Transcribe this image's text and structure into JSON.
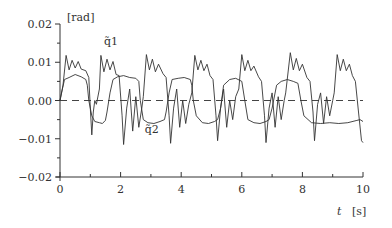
{
  "chart_data": {
    "type": "line",
    "title": "",
    "xlabel": "t",
    "xlabel_unit": "[s]",
    "ylabel": "",
    "ylabel_unit": "[rad]",
    "xlim": [
      0,
      10
    ],
    "ylim": [
      -0.02,
      0.02
    ],
    "x_ticks": [
      0,
      2,
      4,
      6,
      8,
      10
    ],
    "x_tick_labels": [
      "0",
      "2",
      "4",
      "6",
      "8",
      "10"
    ],
    "x_minor_ticks": [
      1,
      3,
      5,
      7,
      9
    ],
    "y_ticks": [
      -0.02,
      -0.01,
      0.0,
      0.01,
      0.02
    ],
    "y_tick_labels": [
      "−0.02",
      "−0.01",
      "0.00",
      "0.01",
      "0.02"
    ],
    "y_minor_ticks": [
      -0.015,
      -0.005,
      0.005,
      0.015
    ],
    "grid": false,
    "reference_line": {
      "y": 0.0,
      "style": "dashed"
    },
    "legend": "inline labels",
    "series": [
      {
        "name": "q̃1",
        "label_position": {
          "t": 1.45,
          "v": 0.0145
        },
        "points": [
          [
            0.0,
            0.0
          ],
          [
            0.1,
            0.004
          ],
          [
            0.2,
            0.0118
          ],
          [
            0.3,
            0.008
          ],
          [
            0.4,
            0.0105
          ],
          [
            0.5,
            0.0085
          ],
          [
            0.6,
            0.0102
          ],
          [
            0.7,
            0.0082
          ],
          [
            0.85,
            0.0078
          ],
          [
            0.95,
            0.006
          ],
          [
            1.0,
            -0.002
          ],
          [
            1.05,
            -0.009
          ],
          [
            1.1,
            -0.003
          ],
          [
            1.15,
            0.0
          ],
          [
            1.2,
            -0.001
          ],
          [
            1.3,
            0.003
          ],
          [
            1.35,
            0.0118
          ],
          [
            1.45,
            0.0075
          ],
          [
            1.55,
            0.0108
          ],
          [
            1.65,
            0.008
          ],
          [
            1.75,
            0.0102
          ],
          [
            1.85,
            0.0068
          ],
          [
            1.95,
            0.0065
          ],
          [
            2.05,
            -0.004
          ],
          [
            2.1,
            -0.0115
          ],
          [
            2.2,
            -0.002
          ],
          [
            2.3,
            0.003
          ],
          [
            2.4,
            -0.008
          ],
          [
            2.5,
            0.001
          ],
          [
            2.6,
            -0.007
          ],
          [
            2.7,
            -0.002
          ],
          [
            2.75,
            0.001
          ],
          [
            2.85,
            0.012
          ],
          [
            2.95,
            0.008
          ],
          [
            3.05,
            0.0108
          ],
          [
            3.15,
            0.0075
          ],
          [
            3.25,
            0.0095
          ],
          [
            3.4,
            0.007
          ],
          [
            3.5,
            0.006
          ],
          [
            3.6,
            -0.004
          ],
          [
            3.65,
            -0.0112
          ],
          [
            3.75,
            -0.002
          ],
          [
            3.85,
            0.003
          ],
          [
            3.95,
            -0.007
          ],
          [
            4.05,
            0.0
          ],
          [
            4.15,
            -0.006
          ],
          [
            4.25,
            -0.001
          ],
          [
            4.35,
            0.002
          ],
          [
            4.45,
            0.0118
          ],
          [
            4.55,
            0.008
          ],
          [
            4.65,
            0.0105
          ],
          [
            4.75,
            0.0078
          ],
          [
            4.85,
            0.0095
          ],
          [
            4.95,
            0.0065
          ],
          [
            5.05,
            0.0055
          ],
          [
            5.15,
            -0.004
          ],
          [
            5.2,
            -0.0105
          ],
          [
            5.3,
            -0.002
          ],
          [
            5.4,
            0.003
          ],
          [
            5.5,
            -0.007
          ],
          [
            5.6,
            0.0
          ],
          [
            5.7,
            -0.005
          ],
          [
            5.8,
            0.001
          ],
          [
            5.9,
            0.003
          ],
          [
            6.0,
            0.012
          ],
          [
            6.1,
            0.0078
          ],
          [
            6.2,
            0.0105
          ],
          [
            6.3,
            0.0078
          ],
          [
            6.4,
            0.009
          ],
          [
            6.55,
            0.0062
          ],
          [
            6.65,
            0.005
          ],
          [
            6.75,
            -0.004
          ],
          [
            6.8,
            -0.011
          ],
          [
            6.9,
            -0.002
          ],
          [
            7.0,
            0.002
          ],
          [
            7.1,
            -0.007
          ],
          [
            7.2,
            0.001
          ],
          [
            7.3,
            -0.005
          ],
          [
            7.4,
            0.0
          ],
          [
            7.45,
            0.002
          ],
          [
            7.6,
            0.0125
          ],
          [
            7.7,
            0.008
          ],
          [
            7.8,
            0.011
          ],
          [
            7.9,
            0.0078
          ],
          [
            8.0,
            0.0095
          ],
          [
            8.15,
            0.006
          ],
          [
            8.25,
            0.005
          ],
          [
            8.35,
            -0.003
          ],
          [
            8.4,
            -0.0105
          ],
          [
            8.5,
            -0.001
          ],
          [
            8.6,
            0.002
          ],
          [
            8.7,
            -0.006
          ],
          [
            8.8,
            0.001
          ],
          [
            8.9,
            -0.004
          ],
          [
            9.0,
            0.0
          ],
          [
            9.05,
            0.002
          ],
          [
            9.15,
            0.012
          ],
          [
            9.25,
            0.0078
          ],
          [
            9.35,
            0.0108
          ],
          [
            9.45,
            0.0078
          ],
          [
            9.55,
            0.0095
          ],
          [
            9.65,
            0.0065
          ],
          [
            9.75,
            0.005
          ],
          [
            9.85,
            -0.003
          ],
          [
            9.95,
            -0.0105
          ],
          [
            10.0,
            -0.011
          ]
        ]
      },
      {
        "name": "q̃2",
        "label_position": {
          "t": 2.8,
          "v": -0.0085
        },
        "points": [
          [
            0.0,
            0.0
          ],
          [
            0.08,
            0.003
          ],
          [
            0.15,
            0.0055
          ],
          [
            0.3,
            0.006
          ],
          [
            0.5,
            0.0068
          ],
          [
            0.7,
            0.0062
          ],
          [
            0.85,
            0.0055
          ],
          [
            0.9,
            0.004
          ],
          [
            0.95,
            0.0
          ],
          [
            1.05,
            -0.004
          ],
          [
            1.15,
            -0.0055
          ],
          [
            1.3,
            -0.0058
          ],
          [
            1.4,
            -0.006
          ],
          [
            1.5,
            -0.0052
          ],
          [
            1.55,
            -0.003
          ],
          [
            1.65,
            0.002
          ],
          [
            1.75,
            0.0055
          ],
          [
            1.9,
            0.0062
          ],
          [
            2.1,
            0.0065
          ],
          [
            2.3,
            0.006
          ],
          [
            2.5,
            0.0058
          ],
          [
            2.6,
            0.005
          ],
          [
            2.65,
            0.0
          ],
          [
            2.75,
            -0.005
          ],
          [
            2.9,
            -0.0058
          ],
          [
            3.1,
            -0.006
          ],
          [
            3.3,
            -0.0055
          ],
          [
            3.45,
            -0.005
          ],
          [
            3.5,
            -0.003
          ],
          [
            3.6,
            0.002
          ],
          [
            3.7,
            0.0055
          ],
          [
            3.9,
            0.0058
          ],
          [
            4.1,
            0.006
          ],
          [
            4.3,
            0.0055
          ],
          [
            4.35,
            0.004
          ],
          [
            4.4,
            0.0
          ],
          [
            4.5,
            -0.004
          ],
          [
            4.7,
            -0.0058
          ],
          [
            4.9,
            -0.006
          ],
          [
            5.1,
            -0.0055
          ],
          [
            5.2,
            -0.005
          ],
          [
            5.3,
            -0.002
          ],
          [
            5.4,
            0.004
          ],
          [
            5.6,
            0.0055
          ],
          [
            5.8,
            0.0058
          ],
          [
            6.0,
            0.005
          ],
          [
            6.1,
            0.0
          ],
          [
            6.2,
            -0.005
          ],
          [
            6.4,
            -0.0058
          ],
          [
            6.6,
            -0.006
          ],
          [
            6.8,
            -0.0055
          ],
          [
            6.9,
            -0.005
          ],
          [
            7.0,
            -0.002
          ],
          [
            7.15,
            0.004
          ],
          [
            7.3,
            0.005
          ],
          [
            7.5,
            0.0055
          ],
          [
            7.7,
            0.005
          ],
          [
            7.85,
            0.0045
          ],
          [
            7.95,
            0.0
          ],
          [
            8.05,
            -0.004
          ],
          [
            8.3,
            -0.0058
          ],
          [
            8.6,
            -0.006
          ],
          [
            8.9,
            -0.0058
          ],
          [
            9.2,
            -0.006
          ],
          [
            9.5,
            -0.0058
          ],
          [
            9.8,
            -0.0052
          ],
          [
            9.9,
            -0.005
          ],
          [
            10.0,
            -0.0055
          ]
        ]
      }
    ]
  }
}
